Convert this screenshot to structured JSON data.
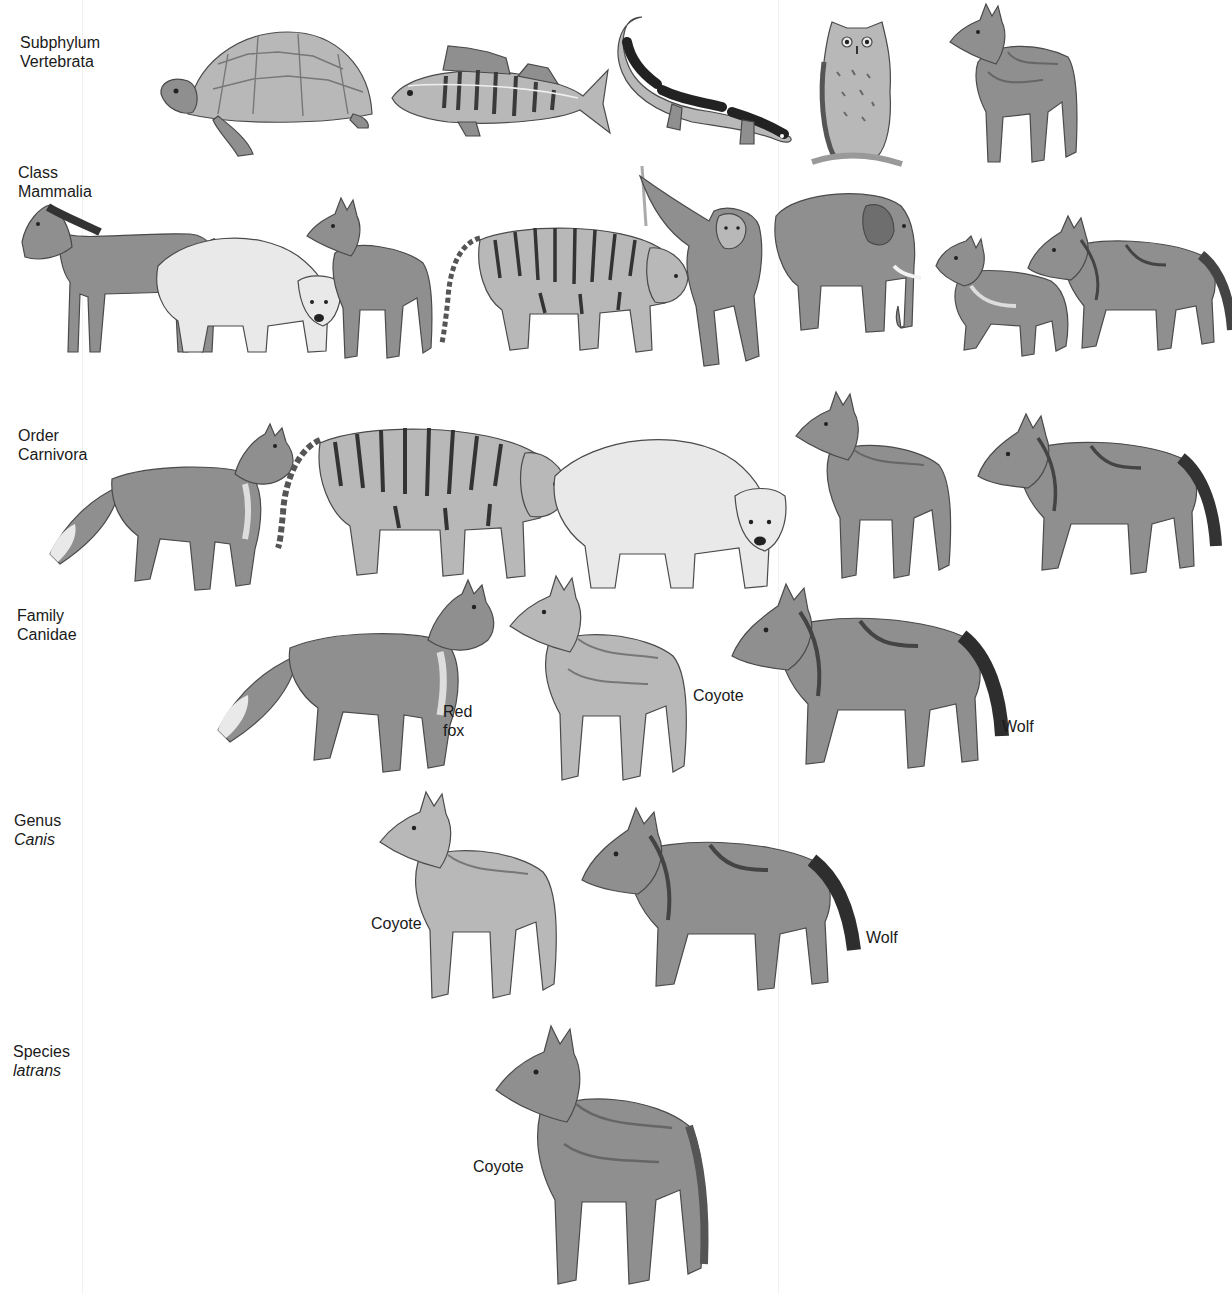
{
  "figure": {
    "colors": {
      "background": "#ffffff",
      "text": "#1a1a1a",
      "drawing_dark": "#5a5a5a",
      "drawing_mid": "#8f8f8f",
      "drawing_light": "#d8d8d8"
    }
  },
  "levels": [
    {
      "rank": "Subphylum",
      "taxon": "Vertebrata",
      "taxon_italic": false,
      "animals": [
        {
          "name": "turtle",
          "label": ""
        },
        {
          "name": "perch",
          "label": ""
        },
        {
          "name": "salamander",
          "label": ""
        },
        {
          "name": "owl",
          "label": ""
        },
        {
          "name": "coyote",
          "label": ""
        }
      ]
    },
    {
      "rank": "Class",
      "taxon": "Mammalia",
      "taxon_italic": false,
      "animals": [
        {
          "name": "horse",
          "label": ""
        },
        {
          "name": "polar-bear",
          "label": ""
        },
        {
          "name": "coyote",
          "label": ""
        },
        {
          "name": "tiger",
          "label": ""
        },
        {
          "name": "orangutan",
          "label": ""
        },
        {
          "name": "elephant",
          "label": ""
        },
        {
          "name": "red-fox",
          "label": ""
        },
        {
          "name": "wolf",
          "label": ""
        }
      ]
    },
    {
      "rank": "Order",
      "taxon": "Carnivora",
      "taxon_italic": false,
      "animals": [
        {
          "name": "red-fox",
          "label": ""
        },
        {
          "name": "tiger",
          "label": ""
        },
        {
          "name": "polar-bear",
          "label": ""
        },
        {
          "name": "coyote",
          "label": ""
        },
        {
          "name": "wolf",
          "label": ""
        }
      ]
    },
    {
      "rank": "Family",
      "taxon": "Canidae",
      "taxon_italic": false,
      "animals": [
        {
          "name": "red-fox",
          "label": "Red\nfox"
        },
        {
          "name": "coyote",
          "label": "Coyote"
        },
        {
          "name": "wolf",
          "label": "Wolf"
        }
      ]
    },
    {
      "rank": "Genus",
      "taxon": "Canis",
      "taxon_italic": true,
      "animals": [
        {
          "name": "coyote",
          "label": "Coyote"
        },
        {
          "name": "wolf",
          "label": "Wolf"
        }
      ]
    },
    {
      "rank": "Species",
      "taxon": "latrans",
      "taxon_italic": true,
      "animals": [
        {
          "name": "coyote",
          "label": "Coyote"
        }
      ]
    }
  ]
}
